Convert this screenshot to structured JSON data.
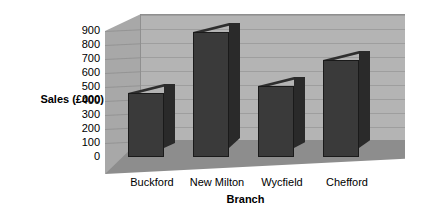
{
  "chart_data": {
    "type": "bar",
    "title": "",
    "subtitle": "",
    "xlabel": "Branch",
    "ylabel": "Sales (£000)",
    "categories": [
      "Buckford",
      "New Milton",
      "Wycfield",
      "Chefford"
    ],
    "values": [
      460,
      890,
      510,
      690
    ],
    "ylim": [
      0,
      900
    ],
    "ytick_labels": [
      "900",
      "800",
      "700",
      "600",
      "500",
      "400",
      "300",
      "200",
      "100",
      "0"
    ],
    "ytick_values": [
      900,
      800,
      700,
      600,
      500,
      400,
      300,
      200,
      100,
      0
    ],
    "grid": true,
    "legend": false,
    "legend_position": "none",
    "style": "3d-column",
    "series": [
      {
        "name": "Sales",
        "values": [
          460,
          890,
          510,
          690
        ]
      }
    ],
    "annotations": []
  },
  "colors": {
    "bar_front": "#3a3a3a",
    "bar_side": "#2a2a2a",
    "bar_top": "#2e2e2e",
    "back_wall": "#b4b4b4",
    "side_wall": "#a8a8a8",
    "floor": "#8d8d8d",
    "gridline": "#9e9e9e",
    "text": "#000000",
    "background": "#ffffff"
  }
}
